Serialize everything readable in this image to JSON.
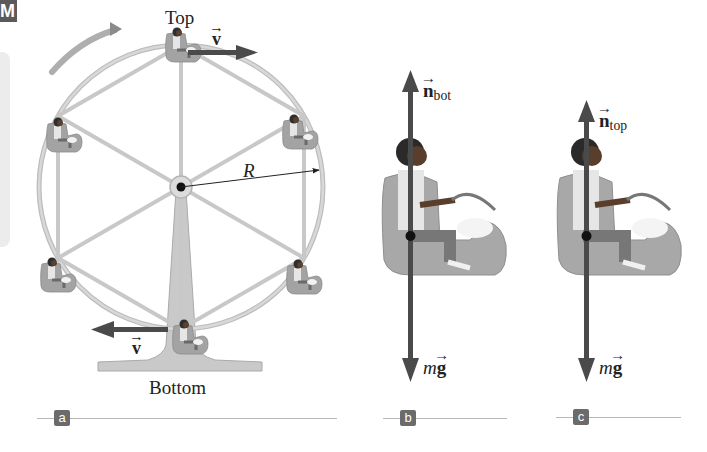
{
  "figure": {
    "corner_tag": "M",
    "panels": [
      {
        "id": "a",
        "tag": "a",
        "description": "Ferris wheel with riders at top and bottom"
      },
      {
        "id": "b",
        "tag": "b",
        "description": "Free-body diagram of rider at bottom"
      },
      {
        "id": "c",
        "tag": "c",
        "description": "Free-body diagram of rider at top"
      }
    ],
    "panel_a": {
      "top_label": "Top",
      "bottom_label": "Bottom",
      "velocity_top_label": "v",
      "velocity_bottom_label": "v",
      "radius_label": "R"
    },
    "panel_b": {
      "normal_force_label": "n",
      "normal_force_subscript": "bot",
      "gravity_label_m": "m",
      "gravity_label_g": "g"
    },
    "panel_c": {
      "normal_force_label": "n",
      "normal_force_subscript": "top",
      "gravity_label_m": "m",
      "gravity_label_g": "g"
    },
    "colors": {
      "wheel": "#c8c8c8",
      "wheel_edge": "#a8a8a8",
      "seat": "#9e9e9e",
      "arrow": "#4a4a4a",
      "rotation_arrow": "#8a8a8a",
      "tag_bg": "#6b6b6b"
    }
  }
}
